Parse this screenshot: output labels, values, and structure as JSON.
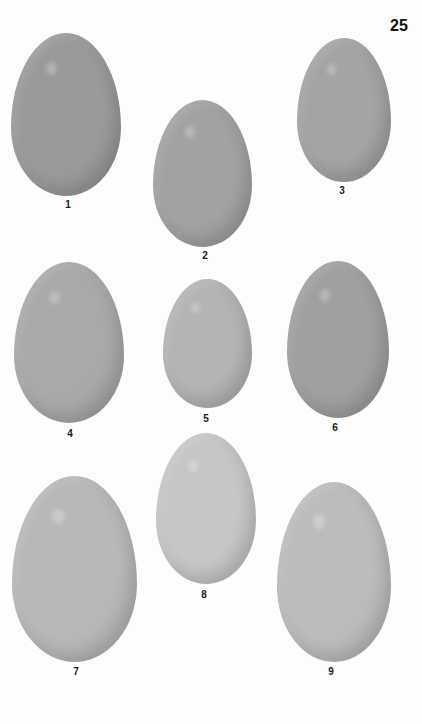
{
  "page": {
    "number": "25"
  },
  "plate": {
    "eggs": [
      {
        "label": "1",
        "x": 11,
        "y": 33,
        "w": 110,
        "h": 163,
        "color": "#9a9a9a",
        "label_x": 68,
        "label_y": 199
      },
      {
        "label": "2",
        "x": 153,
        "y": 100,
        "w": 99,
        "h": 147,
        "color": "#a2a2a2",
        "label_x": 205,
        "label_y": 250
      },
      {
        "label": "3",
        "x": 297,
        "y": 38,
        "w": 94,
        "h": 144,
        "color": "#a4a4a4",
        "label_x": 342,
        "label_y": 185
      },
      {
        "label": "4",
        "x": 14,
        "y": 262,
        "w": 110,
        "h": 161,
        "color": "#a9a9a9",
        "label_x": 70,
        "label_y": 428
      },
      {
        "label": "5",
        "x": 163,
        "y": 279,
        "w": 89,
        "h": 129,
        "color": "#b4b4b4",
        "label_x": 206,
        "label_y": 413
      },
      {
        "label": "6",
        "x": 287,
        "y": 261,
        "w": 102,
        "h": 157,
        "color": "#a0a0a0",
        "label_x": 335,
        "label_y": 422
      },
      {
        "label": "7",
        "x": 12,
        "y": 476,
        "w": 125,
        "h": 186,
        "color": "#b8b8b8",
        "label_x": 76,
        "label_y": 666
      },
      {
        "label": "8",
        "x": 156,
        "y": 433,
        "w": 100,
        "h": 151,
        "color": "#c6c6c6",
        "label_x": 204,
        "label_y": 589
      },
      {
        "label": "9",
        "x": 277,
        "y": 482,
        "w": 114,
        "h": 180,
        "color": "#bcbcbc",
        "label_x": 331,
        "label_y": 666
      }
    ]
  }
}
